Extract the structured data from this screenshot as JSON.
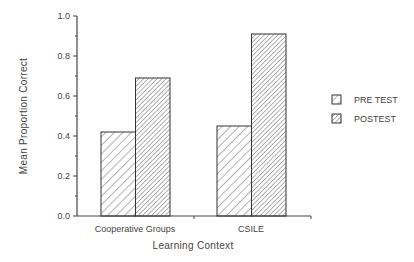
{
  "chart_data": {
    "type": "bar",
    "title": "",
    "xlabel": "Learning Context",
    "ylabel": "Mean Proportion Correct",
    "ylim": [
      0,
      1.0
    ],
    "yticks": [
      "0.0",
      "0.2",
      "0.4",
      "0.6",
      "0.8",
      "1.0"
    ],
    "categories": [
      "Cooperative Groups",
      "CSILE"
    ],
    "series": [
      {
        "name": "PRE TEST",
        "values": [
          0.42,
          0.45
        ],
        "pattern": "sparse-diagonal-hatch"
      },
      {
        "name": "POSTEST",
        "values": [
          0.69,
          0.91
        ],
        "pattern": "dense-diagonal-hatch"
      }
    ],
    "legend_position": "right",
    "grid": false
  },
  "axes": {
    "y_title": "Mean Proportion Correct",
    "x_title": "Learning Context",
    "y_ticks": [
      "0.0",
      "0.2",
      "0.4",
      "0.6",
      "0.8",
      "1.0"
    ],
    "x_categories": [
      "Cooperative Groups",
      "CSILE"
    ]
  },
  "legend": {
    "items": [
      {
        "label": "PRE TEST"
      },
      {
        "label": "POSTEST"
      }
    ]
  }
}
